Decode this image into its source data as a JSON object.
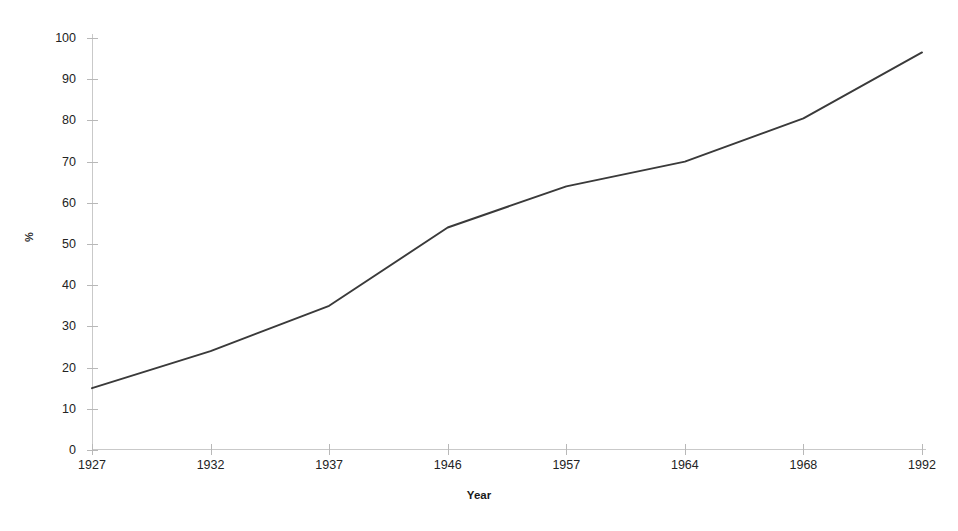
{
  "chart_data": {
    "type": "line",
    "title": "",
    "subtitle": "",
    "xlabel": "Year",
    "ylabel": "%",
    "categories": [
      "1927",
      "1932",
      "1937",
      "1946",
      "1957",
      "1964",
      "1968",
      "1992"
    ],
    "x": [
      1927,
      1932,
      1937,
      1946,
      1957,
      1964,
      1968,
      1992
    ],
    "values": [
      15,
      24,
      35,
      54,
      64,
      70,
      80.5,
      96.5
    ],
    "series": [
      {
        "name": "",
        "values": [
          15,
          24,
          35,
          54,
          64,
          70,
          80.5,
          96.5
        ]
      }
    ],
    "ylim": [
      0,
      100
    ],
    "ytick_step": 10,
    "yticks": [
      0,
      10,
      20,
      30,
      40,
      50,
      60,
      70,
      80,
      90,
      100
    ],
    "ytick_labels": [
      "0",
      "10",
      "20",
      "30",
      "40",
      "50",
      "60",
      "70",
      "80",
      "90",
      "100"
    ],
    "xticks_are_categorical": true,
    "grid": false,
    "legend": false,
    "legend_position": "none",
    "markers": false,
    "line_color": "#3a3a3a",
    "axis_color": "#c9c9c9",
    "background_color": "#ffffff",
    "annotations": []
  }
}
